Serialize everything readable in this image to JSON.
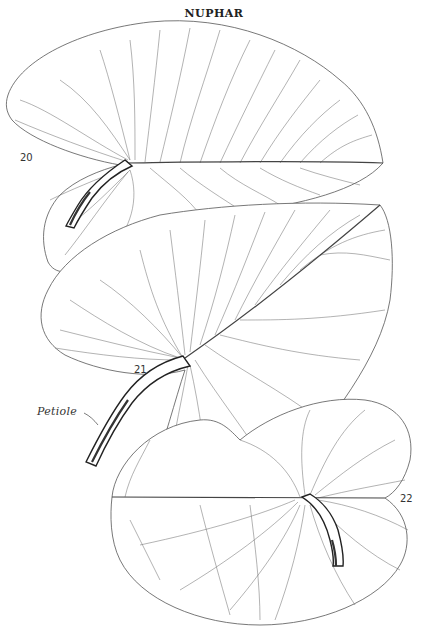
{
  "plate": {
    "title": "NUPHAR",
    "figures": [
      {
        "number": "20",
        "description": "leaf with petiole, apex pointing right"
      },
      {
        "number": "21",
        "description": "leaf with long petiole, apex pointing upper right"
      },
      {
        "number": "22",
        "description": "rounded leaf with short petiole, lower right"
      }
    ],
    "callouts": [
      {
        "label": "Petiole"
      }
    ]
  },
  "colors": {
    "background": "#ffffff",
    "ink": "#333333"
  }
}
